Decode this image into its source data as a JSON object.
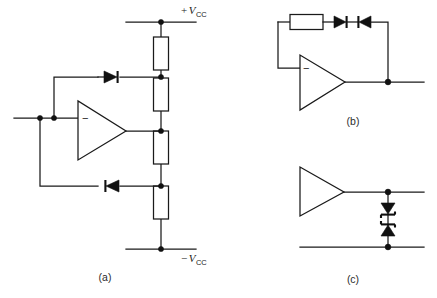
{
  "figure": {
    "background_color": "#ffffff",
    "line_color": "#1a1a1a",
    "width": 437,
    "height": 298
  },
  "captions": {
    "a": "(a)",
    "b": "(b)",
    "c": "(c)"
  },
  "labels": {
    "vcc_positive_sign": "+",
    "vcc_negative_sign": "−",
    "vcc_symbol": "V",
    "vcc_subscript": "CC",
    "opamp_inverting_sign": "−"
  },
  "circuits": [
    {
      "id": "a",
      "caption": "(a)",
      "components": [
        {
          "name": "resistor-a1",
          "type": "resistor",
          "orientation": "vertical"
        },
        {
          "name": "resistor-a2",
          "type": "resistor",
          "orientation": "vertical"
        },
        {
          "name": "resistor-a3",
          "type": "resistor",
          "orientation": "vertical"
        },
        {
          "name": "resistor-a4",
          "type": "resistor",
          "orientation": "vertical"
        },
        {
          "name": "diode-a-upper",
          "type": "diode",
          "orientation": "horizontal",
          "direction": "right"
        },
        {
          "name": "diode-a-lower",
          "type": "diode",
          "orientation": "horizontal",
          "direction": "left"
        },
        {
          "name": "opamp-a",
          "type": "opamp",
          "input_sign": "−"
        }
      ],
      "rails": [
        {
          "name": "rail-positive",
          "label": "+V",
          "subscript": "CC"
        },
        {
          "name": "rail-negative",
          "label": "−V",
          "subscript": "CC"
        }
      ],
      "nodes": 9
    },
    {
      "id": "b",
      "caption": "(b)",
      "components": [
        {
          "name": "resistor-b1",
          "type": "resistor",
          "orientation": "horizontal"
        },
        {
          "name": "diode-b-left",
          "type": "diode",
          "orientation": "horizontal",
          "direction": "right"
        },
        {
          "name": "diode-b-right",
          "type": "diode",
          "orientation": "horizontal",
          "direction": "left"
        },
        {
          "name": "opamp-b",
          "type": "opamp",
          "input_sign": "−"
        }
      ],
      "nodes": 1
    },
    {
      "id": "c",
      "caption": "(c)",
      "components": [
        {
          "name": "opamp-c",
          "type": "opamp",
          "input_sign": ""
        },
        {
          "name": "zener-c-upper",
          "type": "zener-diode",
          "orientation": "vertical",
          "direction": "down"
        },
        {
          "name": "zener-c-lower",
          "type": "zener-diode",
          "orientation": "vertical",
          "direction": "up"
        }
      ],
      "nodes": 2
    }
  ]
}
